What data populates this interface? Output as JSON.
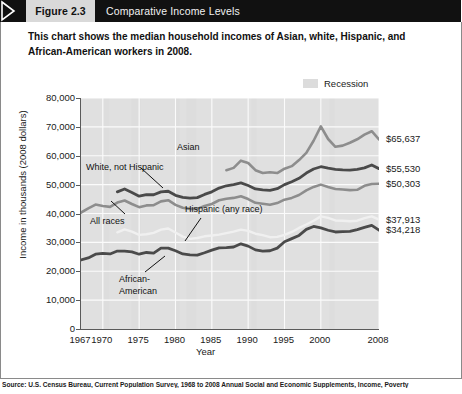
{
  "banner": {
    "figure_label": "Figure 2.3",
    "title": "Comparative Income Levels",
    "arrow_icon": "chevron-right-icon"
  },
  "subtitle": "This chart shows the median household incomes of Asian, white, Hispanic, and African-American workers in 2008.",
  "legend": {
    "recession_label": "Recession",
    "recession_color": "#dcdcdc"
  },
  "source": "Source: U.S. Census Bureau, Current Population Survey, 1968 to 2008 Annual Social and Economic Supplements, Income, Poverty",
  "end_labels": [
    {
      "text": "$65,637",
      "series": "Asian"
    },
    {
      "text": "$55,530",
      "series": "White, not Hispanic"
    },
    {
      "text": "$50,303",
      "series": "All races"
    },
    {
      "text": "$37,913",
      "series": "Hispanic (any race)"
    },
    {
      "text": "$34,218",
      "series": "African-American"
    }
  ],
  "annotations": [
    {
      "text": "Asian"
    },
    {
      "text": "White, not Hispanic"
    },
    {
      "text": "All races"
    },
    {
      "text": "Hispanic (any race)"
    },
    {
      "text": "African-"
    },
    {
      "text": "American"
    }
  ],
  "chart_data": {
    "type": "line",
    "title": "Comparative Income Levels",
    "xlabel": "Year",
    "ylabel": "Income in thousands (2008 dollars)",
    "xlim": [
      1967,
      2008
    ],
    "ylim": [
      0,
      80000
    ],
    "ytick_labels": [
      "80,000",
      "70,000",
      "60,000",
      "50,000",
      "40,000",
      "30,000",
      "20,000",
      "10,000",
      "0"
    ],
    "yticks": [
      80000,
      70000,
      60000,
      50000,
      40000,
      30000,
      20000,
      10000,
      0
    ],
    "xtick_labels": [
      "1967",
      "1970",
      "1975",
      "1980",
      "1985",
      "1990",
      "1995",
      "2000",
      "2008"
    ],
    "xticks": [
      1967,
      1970,
      1975,
      1980,
      1985,
      1990,
      1995,
      2000,
      2008
    ],
    "grid": true,
    "legend_position": "top-right",
    "recession_bands": [
      [
        1969.9,
        1970.9
      ],
      [
        1973.9,
        1975.2
      ],
      [
        1980.0,
        1980.6
      ],
      [
        1981.5,
        1982.9
      ],
      [
        1990.5,
        1991.2
      ],
      [
        2001.2,
        2001.9
      ],
      [
        2007.9,
        2008.0
      ]
    ],
    "series": [
      {
        "name": "Asian",
        "color": "#8d8d8d",
        "width": 2.6,
        "final_value": 65637,
        "x": [
          1987,
          1988,
          1989,
          1990,
          1991,
          1992,
          1993,
          1994,
          1995,
          1996,
          1997,
          1998,
          1999,
          2000,
          2001,
          2002,
          2003,
          2004,
          2005,
          2006,
          2007,
          2008
        ],
        "values": [
          55000,
          55800,
          58300,
          57500,
          55000,
          54000,
          54300,
          54000,
          55500,
          56400,
          58500,
          61000,
          65200,
          70200,
          65800,
          63100,
          63500,
          64500,
          65700,
          67300,
          68500,
          65637
        ]
      },
      {
        "name": "White, not Hispanic",
        "color": "#4a4a4a",
        "width": 2.8,
        "final_value": 55530,
        "x": [
          1972,
          1973,
          1974,
          1975,
          1976,
          1977,
          1978,
          1979,
          1980,
          1981,
          1982,
          1983,
          1984,
          1985,
          1986,
          1987,
          1988,
          1989,
          1990,
          1991,
          1992,
          1993,
          1994,
          1995,
          1996,
          1997,
          1998,
          1999,
          2000,
          2001,
          2002,
          2003,
          2004,
          2005,
          2006,
          2007,
          2008
        ],
        "values": [
          47500,
          48500,
          47300,
          46000,
          46500,
          46500,
          47500,
          47700,
          46300,
          45600,
          45300,
          45500,
          46600,
          47500,
          48800,
          49600,
          50000,
          50600,
          49700,
          48500,
          48200,
          48000,
          48600,
          50000,
          51000,
          52200,
          54000,
          55400,
          56200,
          55700,
          55300,
          55100,
          55000,
          55300,
          55800,
          56800,
          55530
        ]
      },
      {
        "name": "All races",
        "color": "#8d8d8d",
        "width": 2.6,
        "final_value": 50303,
        "x": [
          1967,
          1968,
          1969,
          1970,
          1971,
          1972,
          1973,
          1974,
          1975,
          1976,
          1977,
          1978,
          1979,
          1980,
          1981,
          1982,
          1983,
          1984,
          1985,
          1986,
          1987,
          1988,
          1989,
          1990,
          1991,
          1992,
          1993,
          1994,
          1995,
          1996,
          1997,
          1998,
          1999,
          2000,
          2001,
          2002,
          2003,
          2004,
          2005,
          2006,
          2007,
          2008
        ],
        "values": [
          40300,
          41800,
          43100,
          42600,
          42300,
          43800,
          44500,
          43300,
          42200,
          42800,
          42900,
          44200,
          44600,
          43000,
          42000,
          41600,
          41600,
          42600,
          43300,
          44600,
          45100,
          45400,
          46000,
          45000,
          43700,
          43400,
          43000,
          43600,
          44800,
          45400,
          46400,
          48000,
          49200,
          50000,
          49200,
          48500,
          48300,
          48100,
          48200,
          49600,
          50200,
          50303
        ]
      },
      {
        "name": "Hispanic (any race)",
        "color": "#f0f0f0",
        "width": 2.4,
        "final_value": 37913,
        "x": [
          1972,
          1973,
          1974,
          1975,
          1976,
          1977,
          1978,
          1979,
          1980,
          1981,
          1982,
          1983,
          1984,
          1985,
          1986,
          1987,
          1988,
          1989,
          1990,
          1991,
          1992,
          1993,
          1994,
          1995,
          1996,
          1997,
          1998,
          1999,
          2000,
          2001,
          2002,
          2003,
          2004,
          2005,
          2006,
          2007,
          2008
        ],
        "values": [
          33500,
          34500,
          33700,
          32600,
          32800,
          33300,
          34400,
          34800,
          33400,
          32000,
          31200,
          31500,
          32100,
          32400,
          32700,
          33200,
          33700,
          34400,
          34000,
          33000,
          32500,
          31800,
          31900,
          32600,
          33600,
          35000,
          36200,
          37500,
          39000,
          38500,
          37600,
          37500,
          37300,
          37500,
          38400,
          39000,
          37913
        ]
      },
      {
        "name": "African-American",
        "color": "#4a4a4a",
        "width": 2.8,
        "final_value": 34218,
        "x": [
          1967,
          1968,
          1969,
          1970,
          1971,
          1972,
          1973,
          1974,
          1975,
          1976,
          1977,
          1978,
          1979,
          1980,
          1981,
          1982,
          1983,
          1984,
          1985,
          1986,
          1987,
          1988,
          1989,
          1990,
          1991,
          1992,
          1993,
          1994,
          1995,
          1996,
          1997,
          1998,
          1999,
          2000,
          2001,
          2002,
          2003,
          2004,
          2005,
          2006,
          2007,
          2008
        ],
        "values": [
          23900,
          24600,
          25900,
          26200,
          26000,
          27000,
          27000,
          26700,
          25900,
          26500,
          26300,
          28000,
          28000,
          27100,
          26000,
          25700,
          25600,
          26400,
          27300,
          28100,
          28200,
          28400,
          29500,
          28700,
          27400,
          27000,
          27100,
          28000,
          30200,
          31300,
          32400,
          34500,
          35500,
          35000,
          34200,
          33600,
          33700,
          33800,
          34400,
          35200,
          35900,
          34218
        ]
      }
    ]
  }
}
